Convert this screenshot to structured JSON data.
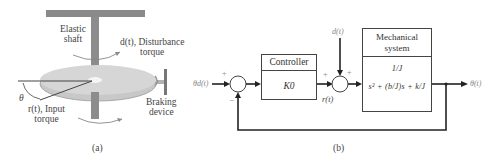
{
  "panel_a": {
    "caption": "(a)",
    "labels": {
      "elastic_shaft_line1": "Elastic",
      "elastic_shaft_line2": "shaft",
      "disturbance_line1": "d(t), Disturbance",
      "disturbance_line2": "torque",
      "theta": "θ",
      "input_torque_line1": "r(t), Input",
      "input_torque_line2": "torque",
      "braking_line1": "Braking",
      "braking_line2": "device"
    }
  },
  "panel_b": {
    "caption": "(b)",
    "input_signal": "θd(t)",
    "output_signal": "θ(t)",
    "disturbance_signal": "d(t)",
    "controller_output": "r(t)",
    "sum1_signs": {
      "top": "+",
      "bottom": "−"
    },
    "sum2_signs": {
      "left": "+",
      "top": "+"
    },
    "controller": {
      "title": "Controller",
      "gain": "K0"
    },
    "plant": {
      "title_line1": "Mechanical",
      "title_line2": "system",
      "numerator": "1/J",
      "denominator": "s² + (b/J)s + k/J"
    }
  }
}
